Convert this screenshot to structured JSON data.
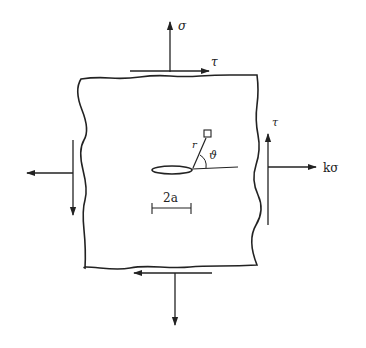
{
  "diagram": {
    "type": "crack-in-plate-stress-diagram",
    "colors": {
      "ink": "#222222",
      "background": "#ffffff"
    },
    "labels": {
      "sigma_top": "σ",
      "tau_top": "τ",
      "tau_right": "τ",
      "k_sigma": "kσ",
      "r": "r",
      "theta": "ϑ",
      "crack_length": "2a"
    },
    "elements": [
      {
        "name": "plate",
        "shape": "rectangle-irregular-edges"
      },
      {
        "name": "crack",
        "shape": "ellipse-slit"
      },
      {
        "name": "polar-point",
        "shape": "small-square"
      },
      {
        "name": "sigma-arrow-top",
        "direction": "up"
      },
      {
        "name": "sigma-arrow-bottom",
        "direction": "down"
      },
      {
        "name": "k-sigma-arrow-right",
        "direction": "right"
      },
      {
        "name": "k-sigma-arrow-left",
        "direction": "left"
      },
      {
        "name": "tau-arrow-top",
        "direction": "right"
      },
      {
        "name": "tau-arrow-bottom",
        "direction": "left"
      },
      {
        "name": "tau-arrow-right",
        "direction": "up"
      },
      {
        "name": "tau-arrow-left",
        "direction": "down"
      }
    ]
  }
}
